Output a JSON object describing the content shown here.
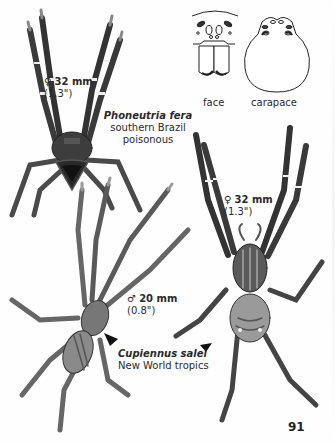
{
  "page": {
    "page_number": "91"
  },
  "diagrams": {
    "face_label": "face",
    "carapace_label": "carapace"
  },
  "species": [
    {
      "name": "Phoneutria fera",
      "range": "southern Brazil",
      "note": "poisonous",
      "specimens": [
        {
          "sex_symbol": "♀",
          "size_mm": "32 mm",
          "size_in": "(1.3\")"
        }
      ]
    },
    {
      "name": "Cupiennus salei",
      "range": "New World tropics",
      "specimens": [
        {
          "sex_symbol": "♂",
          "size_mm": "20 mm",
          "size_in": "(0.8\")"
        },
        {
          "sex_symbol": "♀",
          "size_mm": "32 mm",
          "size_in": "(1.3\")"
        }
      ]
    }
  ],
  "pointers": [
    {
      "icon": "arrowhead-pointer-icon",
      "target": "Cupiennus salei male"
    },
    {
      "icon": "arrowhead-pointer-icon",
      "target": "Cupiennus salei female"
    }
  ]
}
